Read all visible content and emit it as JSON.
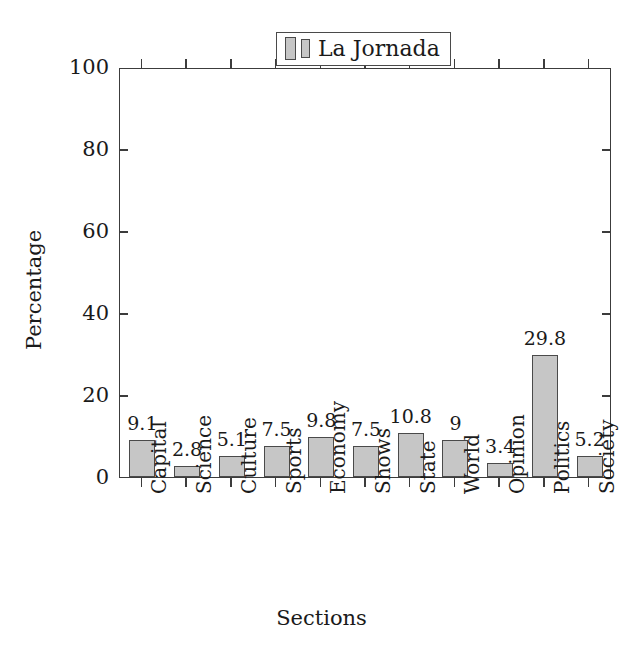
{
  "chart_data": {
    "type": "bar",
    "title": "",
    "xlabel": "Sections",
    "ylabel": "Percentage",
    "categories": [
      "Capital",
      "Science",
      "Culture",
      "Sports",
      "Economy",
      "Shows",
      "State",
      "World",
      "Opinion",
      "Politics",
      "Society"
    ],
    "values": [
      9.1,
      2.8,
      5.1,
      7.5,
      9.8,
      7.5,
      10.8,
      9,
      3.4,
      29.8,
      5.2
    ],
    "value_labels": [
      "9.1",
      "2.8",
      "5.1",
      "7.5",
      "9.8",
      "7.5",
      "10.8",
      "9",
      "3.4",
      "29.8",
      "5.2"
    ],
    "series": [
      {
        "name": "La Jornada",
        "values": [
          9.1,
          2.8,
          5.1,
          7.5,
          9.8,
          7.5,
          10.8,
          9,
          3.4,
          29.8,
          5.2
        ]
      }
    ],
    "ylim": [
      0,
      100
    ],
    "ytick_labels": [
      "0",
      "20",
      "40",
      "60",
      "80",
      "100"
    ],
    "ytick_values": [
      0,
      20,
      40,
      60,
      80,
      100
    ],
    "grid": false,
    "legend": {
      "position": "top-center",
      "entries": [
        "La Jornada"
      ]
    },
    "colors": {
      "bar_fill": "#c6c6c6",
      "bar_border": "#4a4a4a",
      "axis": "#3c3c3c",
      "text": "#1a1a1a",
      "background": "#ffffff"
    }
  },
  "legend": {
    "label": "La Jornada"
  },
  "axes": {
    "x_title": "Sections",
    "y_title": "Percentage"
  }
}
